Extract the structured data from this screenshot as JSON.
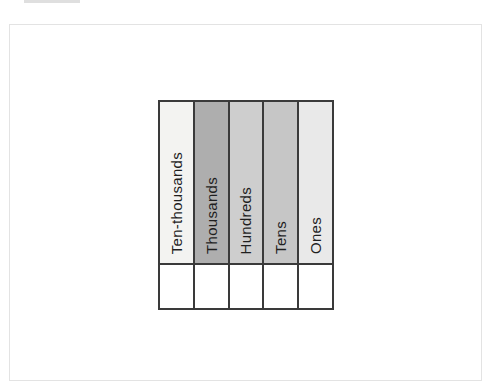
{
  "page": {
    "background_color": "#ffffff",
    "frame_border_color": "#e3e3e3",
    "scan_artifact_color": "#dfdfdf"
  },
  "place_value_chart": {
    "type": "table",
    "grid_color": "#3a3a3a",
    "text_color": "#1f1f1f",
    "body_row_color": "#ffffff",
    "columns": [
      {
        "label": "Ten-thousands",
        "header_color": "#f3f3f1",
        "value": ""
      },
      {
        "label": "Thousands",
        "header_color": "#aeaeae",
        "value": ""
      },
      {
        "label": "Hundreds",
        "header_color": "#cecece",
        "value": ""
      },
      {
        "label": "Tens",
        "header_color": "#c6c6c6",
        "value": ""
      },
      {
        "label": "Ones",
        "header_color": "#e9e9e9",
        "value": ""
      }
    ]
  }
}
